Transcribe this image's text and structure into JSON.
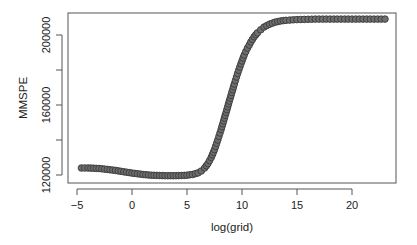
{
  "chart_data": {
    "type": "scatter",
    "title": "",
    "xlabel": "log(grid)",
    "ylabel": "MMSPE",
    "xlim": [
      -5.8,
      24
    ],
    "ylim": [
      117500,
      212000
    ],
    "xticks": [
      -5,
      0,
      5,
      10,
      15,
      20
    ],
    "xtick_labels": [
      "-5",
      "0",
      "5",
      "10",
      "15",
      "20"
    ],
    "yticks": [
      120000,
      140000,
      160000,
      180000,
      200000
    ],
    "ytick_labels": [
      "120000",
      "",
      "160000",
      "",
      "200000"
    ],
    "grid": false,
    "legend": null,
    "marker": "circle",
    "line": true,
    "color": "#555555",
    "series": [
      {
        "name": "MMSPE",
        "x": [
          -4.6,
          -4.0,
          -3.5,
          -3.0,
          -2.5,
          -2.0,
          -1.5,
          -1.0,
          -0.5,
          0.0,
          0.5,
          1.0,
          1.5,
          2.0,
          2.5,
          3.0,
          3.5,
          4.0,
          4.5,
          5.0,
          5.5,
          6.0,
          6.3,
          6.6,
          6.9,
          7.2,
          7.5,
          7.8,
          8.1,
          8.4,
          8.7,
          9.0,
          9.3,
          9.6,
          9.9,
          10.2,
          10.5,
          10.8,
          11.1,
          11.4,
          11.7,
          12.0,
          12.5,
          13.0,
          13.5,
          14.0,
          15.0,
          16.0,
          17.0,
          18.0,
          19.0,
          20.0,
          21.0,
          22.0,
          23.0
        ],
        "y": [
          124000,
          124000,
          123900,
          123700,
          123400,
          123000,
          122600,
          122100,
          121600,
          121100,
          120700,
          120300,
          120000,
          119800,
          119700,
          119600,
          119600,
          119600,
          119700,
          119900,
          120300,
          121200,
          122300,
          124000,
          126500,
          130000,
          134500,
          140000,
          146000,
          152500,
          159000,
          165500,
          172000,
          178000,
          183500,
          188500,
          192500,
          196000,
          199000,
          201200,
          203000,
          204500,
          206200,
          207300,
          208000,
          208400,
          208800,
          209000,
          209100,
          209100,
          209100,
          209100,
          209100,
          209100,
          209100
        ]
      }
    ]
  }
}
